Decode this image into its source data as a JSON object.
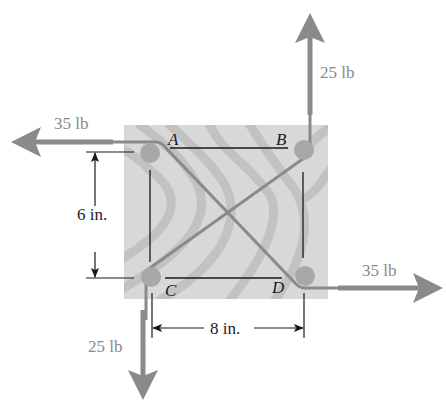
{
  "diagram": {
    "type": "free-body / couple diagram",
    "board": {
      "fill": "#d8d8d8",
      "stripe": "#c0c0c0"
    },
    "colors": {
      "force_arrow": "#8a8a8a",
      "peg": "#a8a8a8",
      "line": "#1a1a1a"
    },
    "points": [
      {
        "id": "A",
        "label": "A"
      },
      {
        "id": "B",
        "label": "B"
      },
      {
        "id": "C",
        "label": "C"
      },
      {
        "id": "D",
        "label": "D"
      }
    ],
    "forces": [
      {
        "at": "A",
        "direction": "left",
        "label": "35 lb"
      },
      {
        "at": "B",
        "direction": "up",
        "label": "25 lb"
      },
      {
        "at": "C",
        "direction": "down",
        "label": "25 lb"
      },
      {
        "at": "D",
        "direction": "right",
        "label": "35 lb"
      }
    ],
    "dimensions": [
      {
        "between": "A-C",
        "orientation": "vertical",
        "label": "6 in."
      },
      {
        "between": "C-D",
        "orientation": "horizontal",
        "label": "8 in."
      }
    ]
  }
}
